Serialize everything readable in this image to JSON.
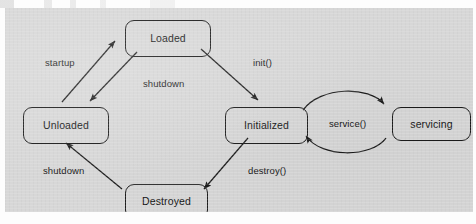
{
  "figure": {
    "kind": "state-transition-diagram",
    "background_color": "#d7d7d7",
    "line_color": "#1c1c1c",
    "text_color": "#141414"
  },
  "states": [
    {
      "id": "loaded",
      "label": "Loaded",
      "x": 120,
      "y": 12,
      "w": 86,
      "h": 37
    },
    {
      "id": "unloaded",
      "label": "Unloaded",
      "x": 18,
      "y": 99,
      "w": 86,
      "h": 37
    },
    {
      "id": "initialized",
      "label": "Initialized",
      "x": 220,
      "y": 99,
      "w": 83,
      "h": 37
    },
    {
      "id": "servicing",
      "label": "servicing",
      "x": 387,
      "y": 99,
      "w": 79,
      "h": 34
    },
    {
      "id": "destroyed",
      "label": "Destroyed",
      "x": 120,
      "y": 176,
      "w": 83,
      "h": 35
    }
  ],
  "transitions": [
    {
      "id": "startup",
      "label": "startup",
      "from": "unloaded",
      "to": "loaded",
      "label_x": 40,
      "label_y": 50
    },
    {
      "id": "shutdown-top",
      "label": "shutdown",
      "from": "loaded",
      "to": "unloaded",
      "label_x": 138,
      "label_y": 71
    },
    {
      "id": "init",
      "label": "init()",
      "from": "loaded",
      "to": "initialized",
      "label_x": 248,
      "label_y": 50
    },
    {
      "id": "destroy",
      "label": "destroy()",
      "from": "initialized",
      "to": "destroyed",
      "label_x": 243,
      "label_y": 158
    },
    {
      "id": "shutdown-bottom",
      "label": "shutdown",
      "from": "destroyed",
      "to": "unloaded",
      "label_x": 38,
      "label_y": 158
    },
    {
      "id": "service",
      "label": "service()",
      "from": "initialized",
      "to": "servicing",
      "label_x": 324,
      "label_y": 111,
      "bidirectional": true
    }
  ]
}
